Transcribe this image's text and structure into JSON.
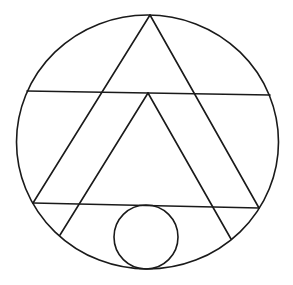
{
  "diagram": {
    "width": 293,
    "height": 285,
    "background": "#ffffff",
    "stroke_color": "#1a1a1a",
    "outer_circle": {
      "cx": 147.5,
      "cy": 142,
      "rx": 131,
      "ry": 127
    },
    "inner_circle": {
      "cx": 146,
      "cy": 237,
      "r": 32
    },
    "lines": [
      {
        "name": "upper-chord",
        "x1": 27,
        "y1": 91,
        "x2": 270,
        "y2": 95
      },
      {
        "name": "lower-chord",
        "x1": 33,
        "y1": 203,
        "x2": 259,
        "y2": 208
      },
      {
        "name": "outer-left-side",
        "x1": 150,
        "y1": 15,
        "x2": 33,
        "y2": 203
      },
      {
        "name": "outer-right-side",
        "x1": 150,
        "y1": 15,
        "x2": 259,
        "y2": 208
      },
      {
        "name": "inner-left-side",
        "x1": 148,
        "y1": 93,
        "x2": 60,
        "y2": 235
      },
      {
        "name": "inner-right-side",
        "x1": 148,
        "y1": 93,
        "x2": 231,
        "y2": 239
      }
    ]
  }
}
